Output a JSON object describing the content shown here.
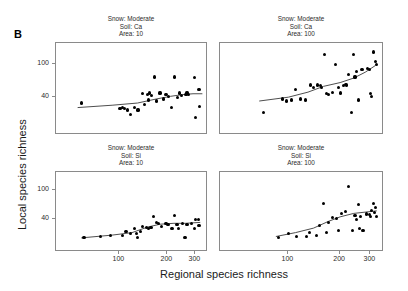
{
  "figure": {
    "panel_letter": "B",
    "axis_titles": {
      "y": "Local species richness",
      "x": "Regional species richness"
    }
  },
  "chart_data": {
    "type": "scatter",
    "title": "",
    "xlabel": "Regional species richness",
    "ylabel": "Local species richness",
    "xscale": "log",
    "yscale": "log",
    "xlim": [
      40,
      360
    ],
    "ylim": [
      14,
      180
    ],
    "xticks": [
      100,
      200,
      300
    ],
    "ytick_labels": [
      "40",
      "100"
    ],
    "yticks": [
      40,
      100
    ],
    "grid": false,
    "legend": null,
    "panel_layout": {
      "rows": 2,
      "cols": 2
    },
    "panels": [
      {
        "id": "ca-10",
        "position": "top-left",
        "strip_lines": [
          "Snow: Moderate",
          "Soil: Ca",
          "Area: 10"
        ],
        "conditions": {
          "snow": "Moderate",
          "soil": "Ca",
          "area": 10
        },
        "points": [
          [
            58,
            34
          ],
          [
            101,
            29
          ],
          [
            104,
            30
          ],
          [
            108,
            29
          ],
          [
            112,
            28
          ],
          [
            118,
            25
          ],
          [
            125,
            30
          ],
          [
            131,
            28
          ],
          [
            140,
            44
          ],
          [
            144,
            33
          ],
          [
            150,
            43
          ],
          [
            152,
            37
          ],
          [
            154,
            45
          ],
          [
            160,
            42
          ],
          [
            166,
            70
          ],
          [
            172,
            36
          ],
          [
            180,
            45
          ],
          [
            190,
            38
          ],
          [
            196,
            43
          ],
          [
            204,
            41
          ],
          [
            212,
            30
          ],
          [
            222,
            70
          ],
          [
            232,
            40
          ],
          [
            238,
            45
          ],
          [
            244,
            42
          ],
          [
            262,
            43
          ],
          [
            266,
            45
          ],
          [
            272,
            43
          ],
          [
            296,
            69
          ],
          [
            302,
            23
          ],
          [
            316,
            50
          ],
          [
            318,
            31
          ]
        ],
        "smoother": [
          [
            55,
            30
          ],
          [
            90,
            32
          ],
          [
            130,
            34
          ],
          [
            170,
            38
          ],
          [
            210,
            41
          ],
          [
            250,
            43
          ],
          [
            290,
            44
          ],
          [
            330,
            44
          ]
        ]
      },
      {
        "id": "ca-100",
        "position": "top-right",
        "strip_lines": [
          "Snow: Moderate",
          "Soil: Ca",
          "Area: 100"
        ],
        "conditions": {
          "snow": "Moderate",
          "soil": "Ca",
          "area": 100
        },
        "points": [
          [
            72,
            26
          ],
          [
            92,
            38
          ],
          [
            98,
            36
          ],
          [
            104,
            37
          ],
          [
            110,
            50
          ],
          [
            118,
            38
          ],
          [
            126,
            37
          ],
          [
            134,
            56
          ],
          [
            140,
            52
          ],
          [
            148,
            56
          ],
          [
            154,
            55
          ],
          [
            156,
            52
          ],
          [
            162,
            130
          ],
          [
            166,
            44
          ],
          [
            172,
            43
          ],
          [
            180,
            46
          ],
          [
            188,
            100
          ],
          [
            196,
            52
          ],
          [
            200,
            45
          ],
          [
            210,
            55
          ],
          [
            214,
            57
          ],
          [
            218,
            56
          ],
          [
            224,
            75
          ],
          [
            232,
            26
          ],
          [
            238,
            132
          ],
          [
            244,
            70
          ],
          [
            250,
            82
          ],
          [
            256,
            37
          ],
          [
            268,
            86
          ],
          [
            288,
            88
          ],
          [
            296,
            86
          ],
          [
            300,
            44
          ],
          [
            304,
            41
          ],
          [
            312,
            140
          ],
          [
            320,
            108
          ],
          [
            324,
            98
          ]
        ],
        "smoother": [
          [
            68,
            36
          ],
          [
            100,
            40
          ],
          [
            130,
            46
          ],
          [
            160,
            54
          ],
          [
            200,
            60
          ],
          [
            240,
            68
          ],
          [
            280,
            80
          ],
          [
            320,
            96
          ]
        ]
      },
      {
        "id": "si-10",
        "position": "bottom-left",
        "strip_lines": [
          "Snow: Moderate",
          "Soil: Si",
          "Area: 10"
        ],
        "conditions": {
          "snow": "Moderate",
          "soil": "Si",
          "area": 10
        },
        "points": [
          [
            60,
            22
          ],
          [
            76,
            23
          ],
          [
            88,
            24
          ],
          [
            104,
            24
          ],
          [
            110,
            27
          ],
          [
            118,
            25
          ],
          [
            124,
            30
          ],
          [
            128,
            25
          ],
          [
            130,
            22
          ],
          [
            136,
            27
          ],
          [
            140,
            32
          ],
          [
            148,
            31
          ],
          [
            152,
            30
          ],
          [
            158,
            31
          ],
          [
            164,
            44
          ],
          [
            170,
            36
          ],
          [
            176,
            35
          ],
          [
            184,
            32
          ],
          [
            196,
            35
          ],
          [
            202,
            34
          ],
          [
            214,
            30
          ],
          [
            222,
            45
          ],
          [
            230,
            34
          ],
          [
            234,
            30
          ],
          [
            248,
            35
          ],
          [
            258,
            22
          ],
          [
            266,
            34
          ],
          [
            284,
            35
          ],
          [
            296,
            30
          ],
          [
            302,
            40
          ],
          [
            312,
            40
          ],
          [
            316,
            33
          ]
        ],
        "smoother": [
          [
            58,
            22
          ],
          [
            90,
            24
          ],
          [
            120,
            26
          ],
          [
            150,
            31
          ],
          [
            180,
            34
          ],
          [
            220,
            35
          ],
          [
            260,
            35
          ],
          [
            320,
            36
          ]
        ]
      },
      {
        "id": "si-100",
        "position": "bottom-right",
        "strip_lines": [
          "Snow: Moderate",
          "Soil: Si",
          "Area: 100"
        ],
        "conditions": {
          "snow": "Moderate",
          "soil": "Si",
          "area": 100
        },
        "points": [
          [
            88,
            22
          ],
          [
            100,
            25
          ],
          [
            112,
            23
          ],
          [
            128,
            23
          ],
          [
            132,
            26
          ],
          [
            146,
            24
          ],
          [
            152,
            33
          ],
          [
            160,
            66
          ],
          [
            166,
            26
          ],
          [
            172,
            36
          ],
          [
            180,
            42
          ],
          [
            190,
            41
          ],
          [
            196,
            28
          ],
          [
            204,
            48
          ],
          [
            216,
            51
          ],
          [
            224,
            113
          ],
          [
            236,
            28
          ],
          [
            244,
            45
          ],
          [
            250,
            40
          ],
          [
            256,
            64
          ],
          [
            260,
            30
          ],
          [
            264,
            43
          ],
          [
            272,
            28
          ],
          [
            286,
            47
          ],
          [
            296,
            46
          ],
          [
            300,
            44
          ],
          [
            304,
            52
          ],
          [
            312,
            66
          ],
          [
            318,
            50
          ],
          [
            322,
            58
          ],
          [
            326,
            44
          ]
        ],
        "smoother": [
          [
            85,
            23
          ],
          [
            110,
            26
          ],
          [
            140,
            30
          ],
          [
            170,
            37
          ],
          [
            200,
            43
          ],
          [
            240,
            48
          ],
          [
            280,
            50
          ],
          [
            325,
            52
          ]
        ]
      }
    ]
  }
}
